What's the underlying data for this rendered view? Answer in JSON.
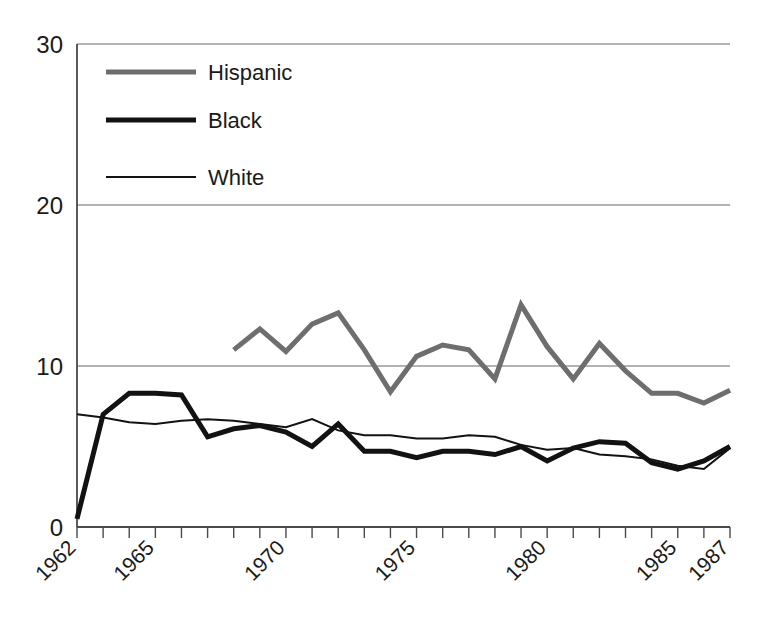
{
  "chart_data": {
    "type": "line",
    "title": "",
    "subtitle": "",
    "xlabel": "",
    "ylabel": "",
    "xlim": [
      1962,
      1987
    ],
    "ylim": [
      0,
      30
    ],
    "yticks": [
      0,
      10,
      20,
      30
    ],
    "ytick_labels": [
      "0",
      "10",
      "20",
      "30"
    ],
    "xticks": [
      1962,
      1963,
      1964,
      1965,
      1966,
      1967,
      1968,
      1969,
      1970,
      1971,
      1972,
      1973,
      1974,
      1975,
      1976,
      1977,
      1978,
      1979,
      1980,
      1981,
      1982,
      1983,
      1984,
      1985,
      1986,
      1987
    ],
    "xtick_labels_shown": [
      "1962",
      "1965",
      "1970",
      "1975",
      "1980",
      "1985",
      "1987"
    ],
    "xtick_labels_shown_values": [
      1962,
      1965,
      1970,
      1975,
      1980,
      1985,
      1987
    ],
    "xtick_label_rotation": -45,
    "grid": "horizontal-only",
    "gridlines_at": [
      10,
      20,
      30
    ],
    "legend_position": "top-left-inside",
    "series": [
      {
        "name": "Hispanic",
        "color": "#6e6e6e",
        "width": 5,
        "x": [
          1968,
          1969,
          1970,
          1971,
          1972,
          1973,
          1974,
          1975,
          1976,
          1977,
          1978,
          1979,
          1980,
          1981,
          1982,
          1983,
          1984,
          1985,
          1986,
          1987
        ],
        "values": [
          11.0,
          12.3,
          10.9,
          12.6,
          13.3,
          11.0,
          8.4,
          10.6,
          11.3,
          11.0,
          9.2,
          13.8,
          11.2,
          9.2,
          11.4,
          9.7,
          8.3,
          8.3,
          7.7,
          8.5
        ]
      },
      {
        "name": "Black",
        "color": "#121212",
        "width": 5,
        "x": [
          1962,
          1963,
          1964,
          1965,
          1966,
          1967,
          1968,
          1969,
          1970,
          1971,
          1972,
          1973,
          1974,
          1975,
          1976,
          1977,
          1978,
          1979,
          1980,
          1981,
          1982,
          1983,
          1984,
          1985,
          1986,
          1987
        ],
        "values": [
          0.5,
          7.0,
          8.3,
          8.3,
          8.2,
          5.6,
          6.1,
          6.3,
          5.9,
          5.0,
          6.4,
          4.7,
          4.7,
          4.3,
          4.7,
          4.7,
          4.5,
          5.0,
          4.1,
          4.9,
          5.3,
          5.2,
          4.0,
          3.6,
          4.1,
          5.0
        ]
      },
      {
        "name": "White",
        "color": "#121212",
        "width": 2,
        "x": [
          1962,
          1963,
          1964,
          1965,
          1966,
          1967,
          1968,
          1969,
          1970,
          1971,
          1972,
          1973,
          1974,
          1975,
          1976,
          1977,
          1978,
          1979,
          1980,
          1981,
          1982,
          1983,
          1984,
          1985,
          1986,
          1987
        ],
        "values": [
          7.0,
          6.8,
          6.5,
          6.4,
          6.6,
          6.7,
          6.6,
          6.4,
          6.2,
          6.7,
          6.0,
          5.7,
          5.7,
          5.5,
          5.5,
          5.7,
          5.6,
          5.1,
          4.8,
          4.9,
          4.5,
          4.4,
          4.2,
          3.8,
          3.6,
          4.9
        ]
      }
    ]
  },
  "legend": {
    "items": [
      {
        "label": "Hispanic",
        "color": "#6e6e6e",
        "width": 5
      },
      {
        "label": "Black",
        "color": "#121212",
        "width": 5
      },
      {
        "label": "White",
        "color": "#121212",
        "width": 2
      }
    ]
  },
  "axes": {
    "y_labels": [
      "30",
      "20",
      "10",
      "0"
    ],
    "x_labels": [
      "1962",
      "1965",
      "1970",
      "1975",
      "1980",
      "1985",
      "1987"
    ]
  },
  "colors": {
    "hispanic": "#6e6e6e",
    "black": "#121212",
    "white_series": "#121212",
    "gridline": "#9a9a9a",
    "axis": "#4a4a4a",
    "background": "#ffffff"
  }
}
